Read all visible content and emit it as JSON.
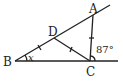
{
  "diagram": {
    "points": {
      "A": {
        "label": "A",
        "x": 93,
        "y": 15
      },
      "B": {
        "label": "B",
        "x": 15,
        "y": 61
      },
      "C": {
        "label": "C",
        "x": 90,
        "y": 61
      },
      "D": {
        "label": "D",
        "x": 54,
        "y": 38
      }
    },
    "segments": [
      "B-A (extended)",
      "B-C (extended)",
      "C-A",
      "D-C"
    ],
    "tick_marks": [
      "BD",
      "DC",
      "CA"
    ],
    "angles": {
      "B": {
        "label": "x"
      },
      "exterior_C": {
        "label": "87°"
      }
    }
  }
}
